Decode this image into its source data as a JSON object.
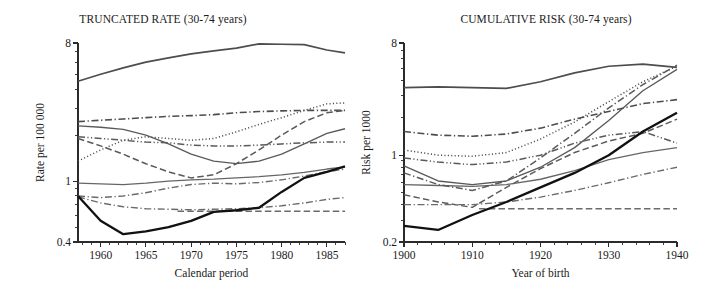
{
  "figure": {
    "background": "#ffffff",
    "panel_count": 2
  },
  "panels": {
    "left": {
      "title": "TRUNCATED RATE (30-74 years)",
      "ylabel": "Rate per 100 000",
      "xlabel": "Calendar period"
    },
    "right": {
      "title": "CUMULATIVE RISK (30-74 years)",
      "ylabel": "Risk per 1000",
      "xlabel": "Year of birth"
    }
  },
  "ticks": {
    "left_y": [
      "8",
      "1",
      "0.4"
    ],
    "left_x": [
      "1960",
      "1965",
      "1970",
      "1975",
      "1980",
      "1985"
    ],
    "right_y": [
      "8",
      "1",
      "0.2"
    ],
    "right_x": [
      "1900",
      "1910",
      "1920",
      "1930",
      "1940"
    ]
  },
  "colors": {
    "axis": "#2b2b2b",
    "text": "#1a1a1a",
    "series_highlight": "#111111",
    "series_default": "#5a5a5a",
    "series_light": "#777777"
  },
  "chart_data": [
    {
      "type": "line",
      "panel": "left",
      "title": "TRUNCATED RATE (30-74 years)",
      "xlabel": "Calendar period",
      "ylabel": "Rate per 100 000",
      "yscale": "log",
      "ylim": [
        0.4,
        8
      ],
      "xlim": [
        1957.5,
        1987
      ],
      "ytick_labels": [
        "8",
        "1",
        "0.4"
      ],
      "ytick_values": [
        8,
        1,
        0.4
      ],
      "xtick_values": [
        1960,
        1965,
        1970,
        1975,
        1980,
        1985
      ],
      "grid": false,
      "legend": "none",
      "series": [
        {
          "name": "series-1-top-solid",
          "style": "solid",
          "width": 1.7,
          "color": "#4d4d4d",
          "x": [
            1957.5,
            1960,
            1962.5,
            1965,
            1967.5,
            1970,
            1972.5,
            1975,
            1977.5,
            1980,
            1982.5,
            1985,
            1987
          ],
          "y": [
            4.5,
            5.0,
            5.5,
            6.0,
            6.4,
            6.8,
            7.1,
            7.4,
            7.9,
            7.85,
            7.8,
            7.2,
            6.9
          ]
        },
        {
          "name": "series-2-dashdot-upper",
          "style": "dashdot",
          "width": 1.6,
          "color": "#4d4d4d",
          "x": [
            1957.5,
            1960,
            1962.5,
            1965,
            1967.5,
            1970,
            1972.5,
            1975,
            1977.5,
            1980,
            1982.5,
            1985,
            1987
          ],
          "y": [
            2.45,
            2.5,
            2.55,
            2.6,
            2.65,
            2.68,
            2.72,
            2.8,
            2.85,
            2.88,
            2.9,
            2.9,
            2.9
          ]
        },
        {
          "name": "series-3-solid-declining",
          "style": "solid",
          "width": 1.35,
          "color": "#5a5a5a",
          "x": [
            1957.5,
            1960,
            1962.5,
            1965,
            1967.5,
            1970,
            1972.5,
            1975,
            1977.5,
            1980,
            1982.5,
            1985,
            1987
          ],
          "y": [
            2.3,
            2.25,
            2.18,
            2.0,
            1.75,
            1.5,
            1.35,
            1.3,
            1.35,
            1.5,
            1.75,
            2.05,
            2.2
          ]
        },
        {
          "name": "series-4-dotted",
          "style": "dotted",
          "width": 1.5,
          "color": "#4d4d4d",
          "x": [
            1957.5,
            1960,
            1962.5,
            1965,
            1967.5,
            1970,
            1972.5,
            1975,
            1977.5,
            1980,
            1982.5,
            1985,
            1987
          ],
          "y": [
            1.35,
            1.6,
            1.85,
            1.95,
            1.9,
            1.85,
            1.9,
            2.1,
            2.35,
            2.6,
            2.9,
            3.2,
            3.25
          ]
        },
        {
          "name": "series-5-dashdotdot",
          "style": "dashdotdot",
          "width": 1.5,
          "color": "#5a5a5a",
          "x": [
            1957.5,
            1960,
            1962.5,
            1965,
            1967.5,
            1970,
            1972.5,
            1975,
            1977.5,
            1980,
            1982.5,
            1985,
            1987
          ],
          "y": [
            1.95,
            1.9,
            1.85,
            1.8,
            1.78,
            1.72,
            1.7,
            1.7,
            1.72,
            1.75,
            1.78,
            1.8,
            1.8
          ]
        },
        {
          "name": "series-6-dashed-rising",
          "style": "dashed-long",
          "width": 1.5,
          "color": "#5a5a5a",
          "x": [
            1957.5,
            1960,
            1962.5,
            1965,
            1967.5,
            1970,
            1972.5,
            1975,
            1977.5,
            1980,
            1982.5,
            1985,
            1987
          ],
          "y": [
            1.9,
            1.7,
            1.5,
            1.3,
            1.15,
            1.05,
            1.1,
            1.3,
            1.6,
            2.0,
            2.45,
            2.8,
            2.9
          ]
        },
        {
          "name": "series-7-solid-flat-mid",
          "style": "solid",
          "width": 1.3,
          "color": "#666666",
          "x": [
            1957.5,
            1960,
            1962.5,
            1965,
            1967.5,
            1970,
            1972.5,
            1975,
            1977.5,
            1980,
            1982.5,
            1985,
            1987
          ],
          "y": [
            0.97,
            0.96,
            0.95,
            0.97,
            1.0,
            1.02,
            1.03,
            1.05,
            1.07,
            1.1,
            1.14,
            1.2,
            1.24
          ]
        },
        {
          "name": "series-8-dashdot-lower",
          "style": "dashdot",
          "width": 1.4,
          "color": "#6b6b6b",
          "x": [
            1957.5,
            1960,
            1962.5,
            1965,
            1967.5,
            1970,
            1972.5,
            1975,
            1977.5,
            1980,
            1982.5,
            1985,
            1987
          ],
          "y": [
            0.8,
            0.78,
            0.8,
            0.84,
            0.9,
            0.95,
            0.97,
            0.96,
            0.98,
            1.02,
            1.08,
            1.15,
            1.2
          ]
        },
        {
          "name": "series-9-dashdot-bottom",
          "style": "dashdot",
          "width": 1.4,
          "color": "#6b6b6b",
          "x": [
            1957.5,
            1960,
            1962.5,
            1965,
            1967.5,
            1970,
            1972.5,
            1975,
            1977.5,
            1980,
            1982.5,
            1985,
            1987
          ],
          "y": [
            0.79,
            0.72,
            0.68,
            0.66,
            0.655,
            0.65,
            0.655,
            0.66,
            0.67,
            0.69,
            0.72,
            0.76,
            0.78
          ]
        },
        {
          "name": "series-10-dashed-flat",
          "style": "dashed-long",
          "width": 1.6,
          "color": "#6b6b6b",
          "x": [
            1968.5,
            1972,
            1975,
            1978,
            1981,
            1984,
            1987
          ],
          "y": [
            0.635,
            0.635,
            0.635,
            0.635,
            0.635,
            0.635,
            0.635
          ]
        },
        {
          "name": "series-11-black-bold",
          "style": "solid",
          "width": 2.3,
          "color": "#111111",
          "x": [
            1957.5,
            1960,
            1962.5,
            1965,
            1967.5,
            1970,
            1972.5,
            1975,
            1977.5,
            1980,
            1982.5,
            1985,
            1987
          ],
          "y": [
            0.8,
            0.55,
            0.45,
            0.47,
            0.5,
            0.55,
            0.63,
            0.645,
            0.67,
            0.85,
            1.05,
            1.15,
            1.25
          ]
        }
      ]
    },
    {
      "type": "line",
      "panel": "right",
      "title": "CUMULATIVE RISK (30-74 years)",
      "xlabel": "Year of birth",
      "ylabel": "Risk per 1000",
      "yscale": "log",
      "ylim": [
        0.2,
        8
      ],
      "xlim": [
        1900,
        1940
      ],
      "ytick_labels": [
        "8",
        "1",
        "0.2"
      ],
      "ytick_values": [
        8,
        1,
        0.2
      ],
      "xtick_values": [
        1900,
        1910,
        1920,
        1930,
        1940
      ],
      "grid": false,
      "legend": "none",
      "series": [
        {
          "name": "series-1-top-solid",
          "style": "solid",
          "width": 1.7,
          "color": "#4d4d4d",
          "x": [
            1900,
            1905,
            1910,
            1915,
            1920,
            1925,
            1930,
            1935,
            1940
          ],
          "y": [
            3.5,
            3.55,
            3.5,
            3.45,
            3.9,
            4.6,
            5.2,
            5.4,
            5.1
          ]
        },
        {
          "name": "series-2-dashdot-upper",
          "style": "dashdot",
          "width": 1.6,
          "color": "#4d4d4d",
          "x": [
            1900,
            1905,
            1910,
            1915,
            1920,
            1925,
            1930,
            1935,
            1940
          ],
          "y": [
            1.55,
            1.45,
            1.42,
            1.48,
            1.65,
            1.95,
            2.25,
            2.6,
            2.8
          ]
        },
        {
          "name": "series-3-dotted",
          "style": "dotted",
          "width": 1.5,
          "color": "#4d4d4d",
          "x": [
            1900,
            1905,
            1910,
            1915,
            1920,
            1925,
            1930,
            1935,
            1940
          ],
          "y": [
            1.1,
            1.0,
            0.98,
            1.05,
            1.35,
            1.85,
            2.7,
            3.9,
            5.2
          ]
        },
        {
          "name": "series-4-dashdotdot",
          "style": "dashdotdot",
          "width": 1.5,
          "color": "#5a5a5a",
          "x": [
            1900,
            1905,
            1910,
            1915,
            1920,
            1925,
            1930,
            1935,
            1940
          ],
          "y": [
            0.95,
            0.88,
            0.84,
            0.88,
            1.0,
            1.25,
            1.45,
            1.55,
            1.25
          ]
        },
        {
          "name": "series-5-solid-rising",
          "style": "solid",
          "width": 1.35,
          "color": "#5a5a5a",
          "x": [
            1900,
            1905,
            1910,
            1915,
            1920,
            1925,
            1930,
            1935,
            1940
          ],
          "y": [
            0.82,
            0.62,
            0.58,
            0.62,
            0.8,
            1.15,
            1.9,
            3.3,
            4.9
          ]
        },
        {
          "name": "series-6-dashed-rising",
          "style": "dashed-long",
          "width": 1.5,
          "color": "#5a5a5a",
          "x": [
            1900,
            1905,
            1910,
            1915,
            1920,
            1925,
            1930,
            1935,
            1940
          ],
          "y": [
            0.48,
            0.42,
            0.38,
            0.55,
            0.78,
            1.05,
            1.3,
            1.5,
            1.95
          ]
        },
        {
          "name": "series-7-solid-lower",
          "style": "solid",
          "width": 1.3,
          "color": "#666666",
          "x": [
            1900,
            1905,
            1910,
            1915,
            1920,
            1925,
            1930,
            1935,
            1940
          ],
          "y": [
            0.58,
            0.57,
            0.56,
            0.58,
            0.64,
            0.75,
            0.92,
            1.05,
            1.15
          ]
        },
        {
          "name": "series-8-dashdot-steep",
          "style": "dashdot",
          "width": 1.5,
          "color": "#5a5a5a",
          "x": [
            1900,
            1905,
            1910,
            1915,
            1920,
            1925,
            1930,
            1935,
            1940
          ],
          "y": [
            0.72,
            0.58,
            0.52,
            0.62,
            0.95,
            1.5,
            2.4,
            3.7,
            5.3
          ]
        },
        {
          "name": "series-9-dashdot-bottom",
          "style": "dashdot",
          "width": 1.4,
          "color": "#6b6b6b",
          "x": [
            1900,
            1905,
            1910,
            1915,
            1920,
            1925,
            1930,
            1935,
            1940
          ],
          "y": [
            0.4,
            0.4,
            0.4,
            0.42,
            0.46,
            0.52,
            0.6,
            0.7,
            0.8
          ]
        },
        {
          "name": "series-10-dashed-flat",
          "style": "dashed-long",
          "width": 1.6,
          "color": "#6b6b6b",
          "x": [
            1911,
            1915,
            1920,
            1925,
            1930,
            1935,
            1940
          ],
          "y": [
            0.37,
            0.37,
            0.37,
            0.37,
            0.37,
            0.37,
            0.37
          ]
        },
        {
          "name": "series-11-black-bold",
          "style": "solid",
          "width": 2.3,
          "color": "#111111",
          "x": [
            1900,
            1905,
            1910,
            1915,
            1920,
            1925,
            1930,
            1935,
            1940
          ],
          "y": [
            0.27,
            0.25,
            0.33,
            0.42,
            0.55,
            0.72,
            1.0,
            1.55,
            2.2
          ]
        }
      ]
    }
  ]
}
